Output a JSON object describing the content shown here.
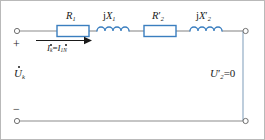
{
  "figure": {
    "kind": "circuit-diagram",
    "width": 265,
    "height": 140,
    "background": "#ffffff",
    "border_color": "#b9b9b9"
  },
  "colors": {
    "component_stroke": "#3a7ebf",
    "component_fill": "#ffffff",
    "wire": "#8c8c8c",
    "wire_right": "#9bb3c9",
    "arrow": "#1a1a1a",
    "text": "#1a1a1a"
  },
  "components": [
    {
      "id": "r1",
      "type": "resistor",
      "label_main": "R",
      "label_sub": "1",
      "label_prime": "",
      "label_text": "R1"
    },
    {
      "id": "x1",
      "type": "inductor",
      "label_prefix": "j",
      "label_main": "X",
      "label_sub": "1",
      "label_prime": "",
      "label_text": "jX1"
    },
    {
      "id": "r2p",
      "type": "resistor",
      "label_main": "R",
      "label_sub": "2",
      "label_prime": "′",
      "label_text": "R2′"
    },
    {
      "id": "x2p",
      "type": "inductor",
      "label_prefix": "j",
      "label_main": "X",
      "label_sub": "2",
      "label_prime": "′",
      "label_text": "jX2′"
    }
  ],
  "annotations": {
    "current": {
      "main": "I",
      "sub": "k",
      "equals": "=",
      "main2": "I",
      "sub2": "1N",
      "text": "İk = İ1N",
      "arrow_direction": "right"
    },
    "input_voltage": {
      "main": "U",
      "sub": "k",
      "text": "U̇k"
    },
    "output_voltage": {
      "main": "U",
      "sub": "2",
      "prime": "′",
      "equals_zero": "=0",
      "text": "U2′=0"
    },
    "polarity_plus": "+",
    "polarity_minus": "−"
  },
  "terminals": [
    {
      "id": "top-left",
      "label": "input-positive-terminal"
    },
    {
      "id": "bottom-left",
      "label": "input-negative-terminal"
    },
    {
      "id": "top-right",
      "label": "output-top-terminal"
    },
    {
      "id": "bottom-right",
      "label": "output-bottom-terminal"
    }
  ]
}
